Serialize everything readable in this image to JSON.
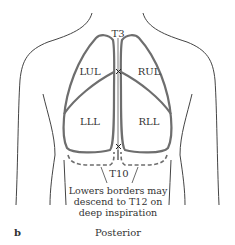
{
  "figure": {
    "panel_letter": "b",
    "view_label": "Posterior",
    "vertebra_top": "T3",
    "vertebra_bottom": "T10",
    "lobes": {
      "left_upper": "LUL",
      "right_upper": "RUL",
      "left_lower": "LLL",
      "right_lower": "RLL"
    },
    "note_lines": [
      "Lowers borders may",
      "descend to T12 on",
      "deep inspiration"
    ],
    "colors": {
      "lung_outline": "#6e6e6e",
      "body_outline": "#444444",
      "text": "#333333"
    }
  }
}
